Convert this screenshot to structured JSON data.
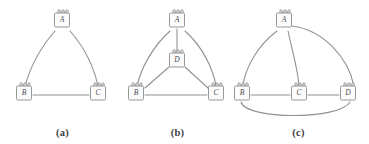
{
  "figure": {
    "background_color": "#ffffff",
    "edge_color": "#8f9294",
    "node_fill": "#fcfcfc",
    "node_stroke": "#8a8d8f",
    "label_color": "#4a4c4e"
  },
  "panels": [
    {
      "id": "a",
      "caption": "(a)",
      "nodes": [
        {
          "id": "A",
          "label": "A",
          "x": 62,
          "y": 22
        },
        {
          "id": "B",
          "label": "B",
          "x": 24,
          "y": 95
        },
        {
          "id": "C",
          "label": "C",
          "x": 98,
          "y": 95
        }
      ],
      "edges": [
        {
          "from": "A",
          "to": "B",
          "style": "curved"
        },
        {
          "from": "A",
          "to": "C",
          "style": "curved"
        },
        {
          "from": "B",
          "to": "C",
          "style": "straight"
        }
      ]
    },
    {
      "id": "b",
      "caption": "(b)",
      "nodes": [
        {
          "id": "A",
          "label": "A",
          "x": 62,
          "y": 22
        },
        {
          "id": "D",
          "label": "D",
          "x": 62,
          "y": 62
        },
        {
          "id": "B",
          "label": "B",
          "x": 21,
          "y": 95
        },
        {
          "id": "C",
          "label": "C",
          "x": 101,
          "y": 95
        }
      ],
      "edges": [
        {
          "from": "A",
          "to": "B",
          "style": "curved"
        },
        {
          "from": "A",
          "to": "C",
          "style": "curved"
        },
        {
          "from": "A",
          "to": "D",
          "style": "straight"
        },
        {
          "from": "D",
          "to": "B",
          "style": "straight"
        },
        {
          "from": "D",
          "to": "C",
          "style": "straight"
        },
        {
          "from": "B",
          "to": "C",
          "style": "straight"
        }
      ]
    },
    {
      "id": "c",
      "caption": "(c)",
      "nodes": [
        {
          "id": "A",
          "label": "A",
          "x": 56,
          "y": 22
        },
        {
          "id": "B",
          "label": "B",
          "x": 14,
          "y": 95
        },
        {
          "id": "C",
          "label": "C",
          "x": 71,
          "y": 95
        },
        {
          "id": "D",
          "label": "D",
          "x": 120,
          "y": 95
        }
      ],
      "edges": [
        {
          "from": "A",
          "to": "B",
          "style": "curved"
        },
        {
          "from": "A",
          "to": "C",
          "style": "curved"
        },
        {
          "from": "A",
          "to": "D",
          "style": "curved-wide"
        },
        {
          "from": "B",
          "to": "C",
          "style": "straight"
        },
        {
          "from": "C",
          "to": "D",
          "style": "straight"
        },
        {
          "from": "B",
          "to": "D",
          "style": "curved-below"
        }
      ]
    }
  ]
}
